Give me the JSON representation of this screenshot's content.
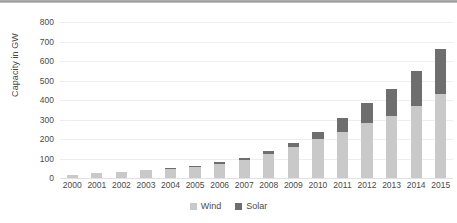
{
  "chart_data": {
    "type": "bar",
    "stacked": true,
    "title": "",
    "subtitle": "",
    "xlabel": "",
    "ylabel": "Capacity in GW",
    "ylim": [
      0,
      800
    ],
    "ytick_step": 100,
    "ytick_labels": [
      "0",
      "100",
      "200",
      "300",
      "400",
      "500",
      "600",
      "700",
      "800"
    ],
    "grid": true,
    "legend_position": "bottom-center",
    "categories": [
      "2000",
      "2001",
      "2002",
      "2003",
      "2004",
      "2005",
      "2006",
      "2007",
      "2008",
      "2009",
      "2010",
      "2011",
      "2012",
      "2013",
      "2014",
      "2015"
    ],
    "series": [
      {
        "name": "Wind",
        "color": "#c9c9c9",
        "values": [
          17,
          24,
          31,
          39,
          47,
          59,
          74,
          94,
          121,
          159,
          198,
          238,
          283,
          319,
          370,
          433
        ]
      },
      {
        "name": "Solar",
        "color": "#6e6e6e",
        "values": [
          1,
          1,
          2,
          2,
          3,
          5,
          6,
          9,
          16,
          23,
          40,
          70,
          100,
          138,
          177,
          227
        ]
      }
    ],
    "totals": [
      18,
      25,
      33,
      41,
      50,
      64,
      80,
      103,
      137,
      182,
      238,
      308,
      383,
      457,
      547,
      660
    ]
  },
  "legend": {
    "items": [
      {
        "label": "Wind",
        "color": "#c9c9c9",
        "swatch_name": "legend-swatch-wind"
      },
      {
        "label": "Solar",
        "color": "#6e6e6e",
        "swatch_name": "legend-swatch-solar"
      }
    ]
  },
  "axis": {
    "y_title": "Capacity in GW"
  },
  "colors": {
    "wind": "#c9c9c9",
    "solar": "#6e6e6e",
    "gridline": "#eeeeee",
    "text": "#4a4a4a",
    "top_rule": "#9a9a9a",
    "background": "#ffffff"
  }
}
